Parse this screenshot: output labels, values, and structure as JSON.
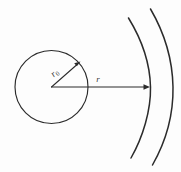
{
  "figure": {
    "background_color": "#fdfdfd",
    "stroke_color": "#2b2b2b",
    "width": 181,
    "height": 172
  },
  "labels": {
    "inner_radius": "r",
    "inner_radius_subscript": "0",
    "outer_radius": "r"
  },
  "geometry": {
    "circle": {
      "center_x": 51.5,
      "center_y": 87,
      "radius": 36.5
    },
    "radius_arrow_inner": {
      "from_x": 51.5,
      "from_y": 87,
      "to_x": 79,
      "to_y": 63,
      "label": "r0"
    },
    "radius_arrow_outer": {
      "from_x": 51.5,
      "from_y": 87,
      "to_x": 150,
      "to_y": 87,
      "label": "r"
    },
    "arcs": [
      {
        "name": "inner-arc",
        "sweep_label": "inner"
      },
      {
        "name": "outer-arc",
        "sweep_label": "outer"
      }
    ]
  }
}
